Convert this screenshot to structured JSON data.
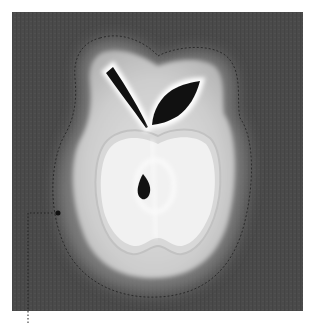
{
  "figure": {
    "description": "Grayscale apple illustration with layered glow and a dotted selection outline, with a callout leader line",
    "colors": {
      "page_background": "#ffffff",
      "panel_background": "#4a4a4a",
      "outer_glow": "#9a9a9a",
      "apple_body": "#cfcfcf",
      "apple_inner_rim": "#e2e2e2",
      "apple_flesh": "#f0f0f0",
      "core_ring": "#fafafa",
      "stem_leaf_seed": "#111111",
      "selection_outline": "#2a2a2a",
      "callout_line": "#222222"
    },
    "elements": {
      "panel": "dark-panel",
      "apple": "apple-shape",
      "stem": "stem",
      "leaf": "leaf",
      "seed": "seed",
      "selection": "selection-outline",
      "callout": "callout-leader-line"
    }
  }
}
